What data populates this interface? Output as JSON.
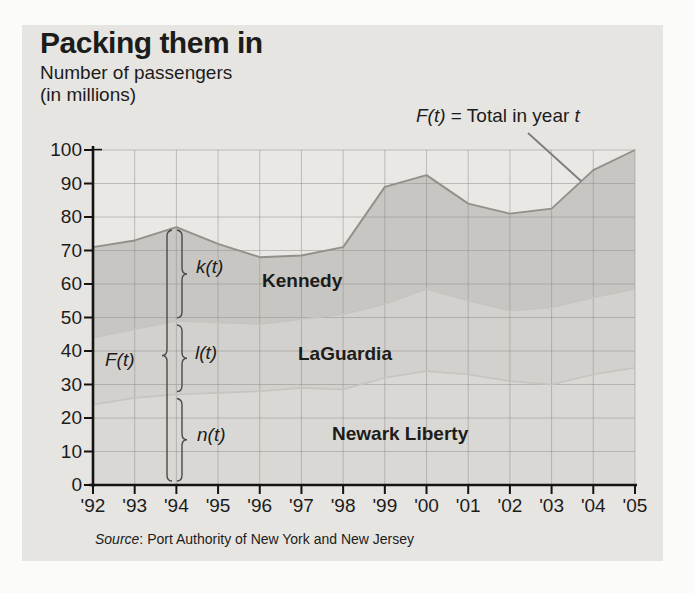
{
  "figure": {
    "title": "Packing them in",
    "subtitle_line1": "Number of passengers",
    "subtitle_line2": "(in millions)",
    "annotation": {
      "fx": "F(t)",
      "eq": " = Total in year ",
      "t": "t"
    },
    "source_word": "Source",
    "source_rest": ": Port Authority of New York and New Jersey"
  },
  "chart_data": {
    "type": "area",
    "stacked": true,
    "title": "Packing them in",
    "ylabel": "Number of passengers (in millions)",
    "ylim": [
      0,
      100
    ],
    "grid": true,
    "y_ticks": [
      0,
      10,
      20,
      30,
      40,
      50,
      60,
      70,
      80,
      90,
      100
    ],
    "x_labels": [
      "'92",
      "'93",
      "'94",
      "'95",
      "'96",
      "'97",
      "'98",
      "'99",
      "'00",
      "'01",
      "'02",
      "'03",
      "'04",
      "'05"
    ],
    "years": [
      1992,
      1993,
      1994,
      1995,
      1996,
      1997,
      1998,
      1999,
      2000,
      2001,
      2002,
      2003,
      2004,
      2005
    ],
    "series": [
      {
        "name": "Newark Liberty",
        "func_label": "n(t)",
        "values": [
          24,
          26,
          27,
          27.5,
          28,
          29,
          28.5,
          32,
          34,
          33,
          31,
          30,
          33,
          35
        ],
        "cumulative": [
          24,
          26,
          27,
          27.5,
          28,
          29,
          28.5,
          32,
          34,
          33,
          31,
          30,
          33,
          35
        ]
      },
      {
        "name": "LaGuardia",
        "func_label": "l(t)",
        "values": [
          20,
          20.5,
          22,
          21,
          20,
          20.5,
          22.5,
          22,
          24.5,
          22,
          21,
          23,
          23,
          23.5
        ],
        "cumulative": [
          44,
          46.5,
          49,
          48.5,
          48,
          49.5,
          51,
          54,
          58.5,
          55,
          52,
          53,
          56,
          58.5
        ]
      },
      {
        "name": "Kennedy",
        "func_label": "k(t)",
        "values": [
          27,
          26.5,
          28,
          23.5,
          20,
          19,
          20,
          35,
          34,
          29,
          29,
          29.5,
          38,
          41.5
        ],
        "cumulative": [
          71,
          73,
          77,
          72,
          68,
          68.5,
          71,
          89,
          92.5,
          84,
          81,
          82.5,
          94,
          100
        ]
      }
    ],
    "total_label": "F(t)",
    "total_annotation": "F(t) = Total in year t",
    "source": "Source: Port Authority of New York and New Jersey",
    "colors": {
      "figure_bg": "#e7e5e2",
      "plot_bg": "#eae8e5",
      "newark_fill": "#dad8d4",
      "laguardia_fill": "#d3d1cd",
      "kennedy_fill": "#c8c6c2",
      "grid": "#8f8e8c",
      "axis": "#141412",
      "total_line": "#92908b",
      "inner_line": "#c6c4c0",
      "brace": "#4a4a46",
      "pointer_line": "#7d7c7a"
    }
  }
}
